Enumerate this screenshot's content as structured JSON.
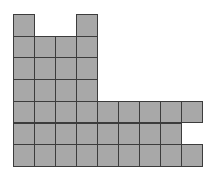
{
  "diagram": {
    "type": "unit-square-grid-figure",
    "columns": 9,
    "rows": 7,
    "origin": {
      "x": 13,
      "y": 14
    },
    "cell_width": 21,
    "cell_height": 21.7,
    "colors": {
      "fill": "#a8a8a8",
      "border": "#3c3c3c",
      "background": "#ffffff"
    },
    "filled_cells_by_row": [
      [
        0,
        3
      ],
      [
        0,
        1,
        2,
        3
      ],
      [
        0,
        1,
        2,
        3
      ],
      [
        0,
        1,
        2,
        3
      ],
      [
        0,
        1,
        2,
        3,
        4,
        5,
        6,
        7,
        8
      ],
      [
        0,
        1,
        2,
        3,
        4,
        5,
        6,
        7
      ],
      [
        0,
        1,
        2,
        3,
        4,
        5,
        6,
        7,
        8
      ]
    ],
    "total_squares": 40
  }
}
